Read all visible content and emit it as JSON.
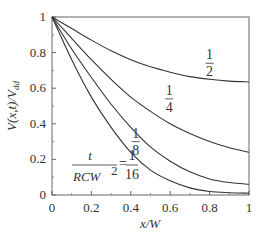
{
  "chart_data": {
    "type": "line",
    "title": "",
    "xlabel": "x/W",
    "ylabel": "V(x,t)/V_dd",
    "xlim": [
      0,
      1
    ],
    "ylim": [
      0,
      1
    ],
    "grid": false,
    "x_ticks": [
      "0",
      "0.2",
      "0.4",
      "0.6",
      "0.8",
      "1"
    ],
    "y_ticks": [
      "0",
      "0.2",
      "0.4",
      "0.6",
      "0.8",
      "1"
    ],
    "x": [
      0,
      0.1,
      0.2,
      0.3,
      0.4,
      0.5,
      0.6,
      0.7,
      0.8,
      0.9,
      1.0
    ],
    "series": [
      {
        "name": "1/2",
        "label_num": "1",
        "label_den": "2",
        "values": [
          1,
          0.935,
          0.87,
          0.81,
          0.76,
          0.72,
          0.69,
          0.665,
          0.65,
          0.64,
          0.635
        ]
      },
      {
        "name": "1/4",
        "label_num": "1",
        "label_den": "4",
        "values": [
          1,
          0.88,
          0.76,
          0.65,
          0.55,
          0.47,
          0.4,
          0.345,
          0.3,
          0.265,
          0.24
        ]
      },
      {
        "name": "1/8",
        "label_num": "1",
        "label_den": "8",
        "values": [
          1,
          0.82,
          0.66,
          0.51,
          0.38,
          0.27,
          0.19,
          0.13,
          0.09,
          0.07,
          0.06
        ]
      },
      {
        "name": "1/16",
        "label_num": "1",
        "label_den": "16",
        "values": [
          1,
          0.76,
          0.55,
          0.38,
          0.24,
          0.14,
          0.08,
          0.04,
          0.02,
          0.013,
          0.01
        ]
      }
    ],
    "annotation": {
      "lhs_num": "t",
      "lhs_den": "RCW",
      "lhs_exp": "2",
      "eq": "="
    }
  }
}
